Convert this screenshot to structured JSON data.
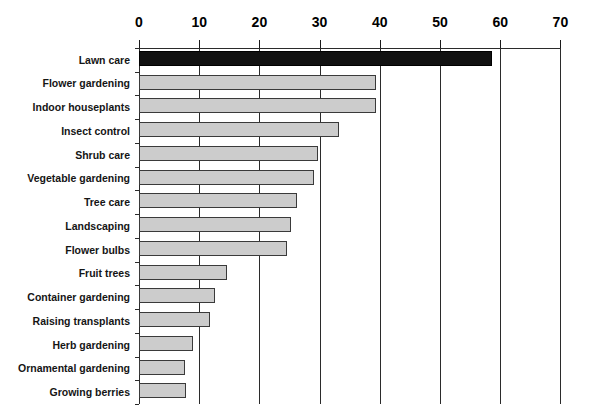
{
  "chart_data": {
    "type": "bar",
    "orientation": "horizontal",
    "title": "",
    "xlabel": "",
    "ylabel": "",
    "xlim": [
      0,
      70
    ],
    "xticks": [
      0,
      10,
      20,
      30,
      40,
      50,
      60,
      70
    ],
    "grid": true,
    "legend": null,
    "categories": [
      "Lawn care",
      "Flower gardening",
      "Indoor houseplants",
      "Insect control",
      "Shrub care",
      "Vegetable gardening",
      "Tree care",
      "Landscaping",
      "Flower bulbs",
      "Fruit trees",
      "Container gardening",
      "Raising transplants",
      "Herb gardening",
      "Ornamental gardening",
      "Growing berries"
    ],
    "values": [
      58.6,
      39.3,
      39.3,
      33.3,
      29.8,
      29.0,
      26.2,
      25.3,
      24.6,
      14.7,
      12.7,
      11.8,
      9.0,
      7.7,
      7.8
    ],
    "bar_colors": [
      "#111111",
      "#cccccc",
      "#cccccc",
      "#cccccc",
      "#cccccc",
      "#cccccc",
      "#cccccc",
      "#cccccc",
      "#cccccc",
      "#cccccc",
      "#cccccc",
      "#cccccc",
      "#cccccc",
      "#cccccc",
      "#cccccc"
    ],
    "highlight_index": 0,
    "colors": {
      "bar_fill": "#cccccc",
      "bar_edge": "#3a3a3a",
      "highlight_fill": "#111111",
      "axis": "#2b2b2b",
      "text": "#151515",
      "background": "#ffffff"
    }
  }
}
